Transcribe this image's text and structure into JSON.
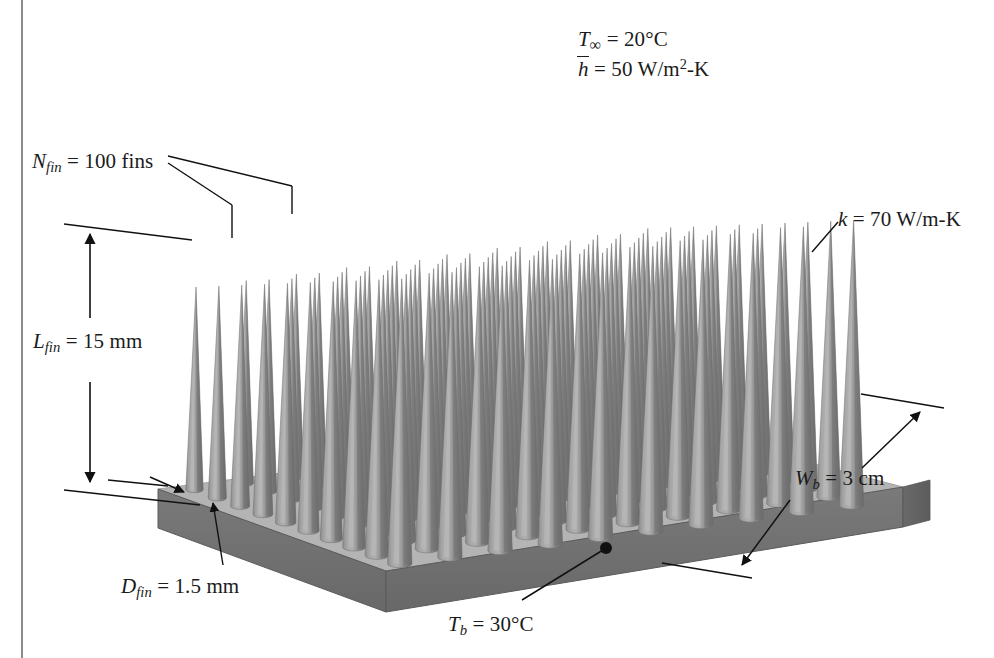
{
  "figure": {
    "type": "engineering-diagram",
    "background_color": "#ffffff",
    "border_line_color": "#8a8a8a",
    "geometry": {
      "fin_rows": 10,
      "fin_cols": 10,
      "fin_shape": "cone",
      "fin_count": 100,
      "base_shape": "square-plate"
    },
    "colors": {
      "fin_light": "#a9a9a9",
      "fin_mid": "#8f8f8f",
      "fin_dark": "#6e6e6e",
      "base_top": "#b4b4b4",
      "base_front": "#6f6f6f",
      "base_side": "#5f5f5f",
      "base_edge": "#4a4a4a",
      "ink": "#1b1b1b"
    }
  },
  "labels": {
    "ambient_temperature": {
      "name": "T-infinity",
      "symbol": "T",
      "subscript": "∞",
      "value": "20",
      "unit": "°C",
      "text": "T∞ = 20°C"
    },
    "heat_transfer_coefficient": {
      "name": "h-bar",
      "symbol": "h",
      "accent": "overbar",
      "value": "50",
      "unit": "W/m2-K",
      "text": "h̄ = 50 W/m2-K"
    },
    "fin_count": {
      "name": "N-fin",
      "symbol": "N",
      "subscript": "fin",
      "value": "100",
      "unit": "fins",
      "text": "Nfin = 100 fins"
    },
    "fin_length": {
      "name": "L-fin",
      "symbol": "L",
      "subscript": "fin",
      "value": "15",
      "unit": "mm",
      "text": "Lfin = 15 mm"
    },
    "fin_diameter": {
      "name": "D-fin",
      "symbol": "D",
      "subscript": "fin",
      "value": "1.5",
      "unit": "mm",
      "text": "Dfin = 1.5 mm"
    },
    "base_temperature": {
      "name": "T-b",
      "symbol": "T",
      "subscript": "b",
      "value": "30",
      "unit": "°C",
      "text": "Tb = 30°C"
    },
    "thermal_conductivity": {
      "name": "k",
      "symbol": "k",
      "value": "70",
      "unit": "W/m-K",
      "text": "k = 70 W/m-K"
    },
    "base_width": {
      "name": "W-b",
      "symbol": "W",
      "subscript": "b",
      "value": "3",
      "unit": "cm",
      "text": "Wb = 3 cm"
    }
  },
  "parts": {
    "equals": "=",
    "degree_c": "°C",
    "fins_word": "fins",
    "mm": "mm",
    "cm": "cm",
    "w_m2_k": "W/m",
    "w_m_k": "W/m-K",
    "dash_k": "-K",
    "two": "2",
    "infinity": "∞",
    "sub_fin": "fin",
    "sub_b": "b",
    "v_T": "T",
    "v_N": "N",
    "v_L": "L",
    "v_D": "D",
    "v_W": "W",
    "v_h": "h",
    "v_k": "k",
    "val_20": "20",
    "val_50": "50",
    "val_100": "100",
    "val_15": "15",
    "val_1_5": "1.5",
    "val_30": "30",
    "val_70": "70",
    "val_3": "3"
  }
}
